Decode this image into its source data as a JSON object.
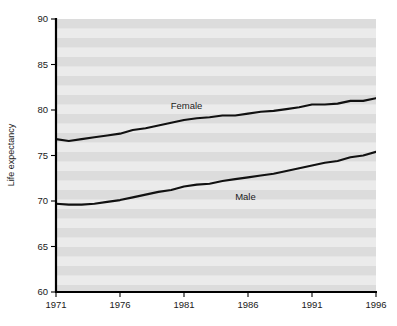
{
  "chart_data": {
    "type": "line",
    "title": "",
    "subtitle": "",
    "xlabel": "",
    "ylabel": "Life expectancy",
    "xlim": [
      1971,
      1996
    ],
    "ylim": [
      60,
      90
    ],
    "xticks": [
      1971,
      1976,
      1981,
      1986,
      1991,
      1996
    ],
    "xtick_labels": [
      "1971",
      "1976",
      "1981",
      "1986",
      "1991",
      "1996"
    ],
    "yticks": [
      60,
      65,
      70,
      75,
      80,
      85,
      90
    ],
    "ytick_labels": [
      "60",
      "65",
      "70",
      "75",
      "80",
      "85",
      "90"
    ],
    "grid": false,
    "background_bands": true,
    "legend": "inline-annotations",
    "x": [
      1971,
      1972,
      1973,
      1974,
      1975,
      1976,
      1977,
      1978,
      1979,
      1980,
      1981,
      1982,
      1983,
      1984,
      1985,
      1986,
      1987,
      1988,
      1989,
      1990,
      1991,
      1992,
      1993,
      1994,
      1995,
      1996
    ],
    "series": [
      {
        "name": "Female",
        "label": "Female",
        "label_x": 1981.2,
        "label_y": 80.1,
        "color": "#111111",
        "values": [
          76.8,
          76.6,
          76.8,
          77.0,
          77.2,
          77.4,
          77.8,
          78.0,
          78.3,
          78.6,
          78.9,
          79.1,
          79.2,
          79.4,
          79.4,
          79.6,
          79.8,
          79.9,
          80.1,
          80.3,
          80.6,
          80.6,
          80.7,
          81.0,
          81.0,
          81.3
        ]
      },
      {
        "name": "Male",
        "label": "Male",
        "label_x": 1985.8,
        "label_y": 70.1,
        "color": "#111111",
        "values": [
          69.7,
          69.6,
          69.6,
          69.7,
          69.9,
          70.1,
          70.4,
          70.7,
          71.0,
          71.2,
          71.6,
          71.8,
          71.9,
          72.2,
          72.4,
          72.6,
          72.8,
          73.0,
          73.3,
          73.6,
          73.9,
          74.2,
          74.4,
          74.8,
          75.0,
          75.4
        ]
      }
    ]
  }
}
